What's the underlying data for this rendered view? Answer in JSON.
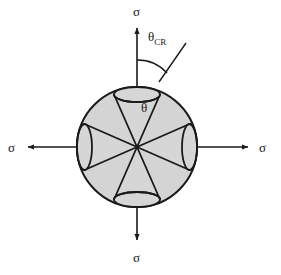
{
  "figure": {
    "type": "technical-diagram",
    "colors": {
      "sphere_fill": "#d4d4d4",
      "cone_fill": "#d6d6d6",
      "stroke": "#1a1a1a",
      "background": "#ffffff"
    },
    "geometry": {
      "circle_center_x": 137,
      "circle_center_y": 147,
      "circle_radius": 60,
      "cone_half_angle_deg": 22,
      "cone_count": 4
    }
  },
  "labels": {
    "sigma_top": "σ",
    "sigma_bottom": "σ",
    "sigma_left": "σ",
    "sigma_right": "σ",
    "theta_cr_symbol": "θ",
    "theta_cr_subscript": "CR",
    "theta_symbol": "θ"
  },
  "arrows": {
    "top": {
      "direction": "up",
      "label": "σ"
    },
    "bottom": {
      "direction": "down",
      "label": "σ"
    },
    "left": {
      "direction": "left",
      "label": "σ"
    },
    "right": {
      "direction": "right",
      "label": "σ"
    }
  }
}
